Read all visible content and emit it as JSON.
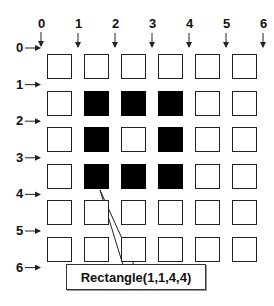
{
  "diagram": {
    "column_labels": [
      "0",
      "1",
      "2",
      "3",
      "4",
      "5",
      "6"
    ],
    "row_labels": [
      "0",
      "1",
      "2",
      "3",
      "4",
      "5",
      "6"
    ],
    "grid": {
      "rows": 6,
      "cols": 6,
      "filled_cells": [
        [
          1,
          1
        ],
        [
          1,
          2
        ],
        [
          1,
          3
        ],
        [
          2,
          1
        ],
        [
          2,
          3
        ],
        [
          3,
          1
        ],
        [
          3,
          2
        ],
        [
          3,
          3
        ]
      ]
    },
    "callout": {
      "label": "Rectangle(1,1,4,4)"
    },
    "colors": {
      "filled": "#000000",
      "border": "#222222",
      "background": "#ffffff"
    }
  }
}
